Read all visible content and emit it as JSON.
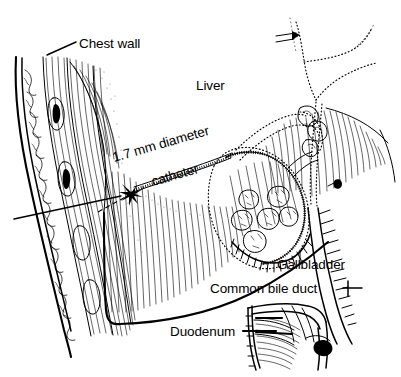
{
  "figure": {
    "title": "Percutaneous transhepatic cholecystostomy",
    "ink_color": "#000000",
    "background_color": "#ffffff"
  },
  "labels": {
    "chest_wall": "Chest wall",
    "liver": "Liver",
    "catheter_line1": "1.7 mm diameter",
    "catheter_line2": "catheter",
    "gallbladder": "Gallbladder",
    "common_bile_duct": "Common bile duct",
    "duodenum": "Duodenum"
  },
  "annotations": {
    "catheter_diameter_value": "1.7",
    "catheter_diameter_unit": "mm",
    "gallstone_count": 6
  },
  "structures": [
    {
      "name": "chest-wall",
      "label": "Chest wall"
    },
    {
      "name": "liver",
      "label": "Liver"
    },
    {
      "name": "catheter",
      "label": "1.7 mm diameter catheter"
    },
    {
      "name": "gallbladder",
      "label": "Gallbladder"
    },
    {
      "name": "gallstones",
      "label": "Gallstones"
    },
    {
      "name": "common-bile-duct",
      "label": "Common bile duct"
    },
    {
      "name": "duodenum",
      "label": "Duodenum"
    },
    {
      "name": "hepatic-ducts",
      "label": "Hepatic ducts"
    }
  ]
}
